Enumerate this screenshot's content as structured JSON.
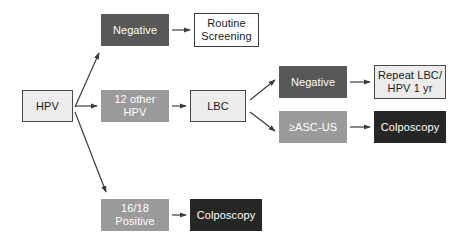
{
  "diagram": {
    "colors": {
      "white": "#ffffff",
      "light_gray": "#ececec",
      "mid_gray": "#9a9a9a",
      "dark_gray": "#585858",
      "near_black": "#262626",
      "arrow": "#3c3c3c",
      "background": "#ffffff"
    },
    "nodes": [
      {
        "id": "hpv",
        "label": "HPV",
        "fill": "fill-lightgray",
        "x": 22,
        "y": 90,
        "w": 51,
        "h": 32
      },
      {
        "id": "negative-top",
        "label": "Negative",
        "fill": "fill-darkgray",
        "x": 101,
        "y": 14,
        "w": 68,
        "h": 32
      },
      {
        "id": "routine-screening",
        "label": "Routine\nScreening",
        "fill": "fill-white",
        "x": 194,
        "y": 13,
        "w": 65,
        "h": 34
      },
      {
        "id": "twelve-other-hpv",
        "label": "12 other\nHPV",
        "fill": "fill-midgray",
        "x": 101,
        "y": 90,
        "w": 68,
        "h": 32
      },
      {
        "id": "lbc",
        "label": "LBC",
        "fill": "fill-lightgray",
        "x": 190,
        "y": 90,
        "w": 56,
        "h": 32
      },
      {
        "id": "negative-lbc",
        "label": "Negative",
        "fill": "fill-darkgray",
        "x": 279,
        "y": 66,
        "w": 68,
        "h": 32
      },
      {
        "id": "repeat-lbc-hpv",
        "label": "Repeat LBC/\nHPV 1 yr",
        "fill": "fill-lightgray",
        "x": 374,
        "y": 65,
        "w": 72,
        "h": 34
      },
      {
        "id": "asc-us",
        "label": "≥ASC-US",
        "fill": "fill-midgray",
        "x": 279,
        "y": 111,
        "w": 68,
        "h": 32
      },
      {
        "id": "colposcopy-asc",
        "label": "Colposcopy",
        "fill": "fill-black",
        "x": 374,
        "y": 111,
        "w": 72,
        "h": 32
      },
      {
        "id": "sixteen-eighteen-positive",
        "label": "16/18\nPositive",
        "fill": "fill-midgray",
        "x": 101,
        "y": 199,
        "w": 68,
        "h": 32
      },
      {
        "id": "colposcopy-1618",
        "label": "Colposcopy",
        "fill": "fill-black",
        "x": 190,
        "y": 199,
        "w": 72,
        "h": 32
      }
    ],
    "edges": [
      {
        "id": "hpv-to-negative-top",
        "from": "hpv",
        "to": "negative-top",
        "d": "M 75 107 L 99 53"
      },
      {
        "id": "hpv-to-12-other",
        "from": "hpv",
        "to": "twelve-other-hpv",
        "d": "M 75 106 L 97 106"
      },
      {
        "id": "hpv-to-1618",
        "from": "hpv",
        "to": "sixteen-eighteen-positive",
        "d": "M 75 112 L 106 192"
      },
      {
        "id": "negative-top-to-routine",
        "from": "negative-top",
        "to": "routine-screening",
        "d": "M 172 30 L 190 30"
      },
      {
        "id": "12-other-to-lbc",
        "from": "twelve-other-hpv",
        "to": "lbc",
        "d": "M 172 106 L 186 106"
      },
      {
        "id": "lbc-to-negative",
        "from": "lbc",
        "to": "negative-lbc",
        "d": "M 250 100 L 275 80"
      },
      {
        "id": "lbc-to-asc-us",
        "from": "lbc",
        "to": "asc-us",
        "d": "M 250 112 L 275 131"
      },
      {
        "id": "negative-to-repeat",
        "from": "negative-lbc",
        "to": "repeat-lbc-hpv",
        "d": "M 350 82 L 370 82"
      },
      {
        "id": "asc-us-to-colposcopy",
        "from": "asc-us",
        "to": "colposcopy-asc",
        "d": "M 350 127 L 370 127"
      },
      {
        "id": "1618-to-colposcopy",
        "from": "sixteen-eighteen-positive",
        "to": "colposcopy-1618",
        "d": "M 172 215 L 186 215"
      }
    ]
  }
}
